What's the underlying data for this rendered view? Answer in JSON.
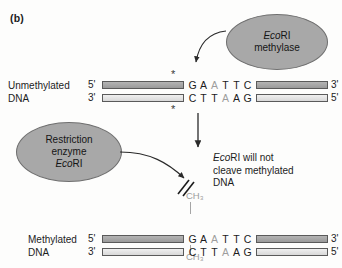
{
  "figure": {
    "panel_label": "(b)"
  },
  "enzymes": {
    "methylase": {
      "name_italic": "Eco",
      "name_roman": "RI",
      "line2": "methylase"
    },
    "restriction": {
      "line1": "Restriction",
      "line2": "enzyme",
      "name_italic": "Eco",
      "name_roman": "RI"
    }
  },
  "rows": {
    "unmethylated": {
      "label_line1": "Unmethylated",
      "label_line2": "DNA",
      "top_left_end": "5'",
      "top_right_end": "3'",
      "bottom_left_end": "3'",
      "bottom_right_end": "5'",
      "top_bases": [
        "G",
        "A",
        "A",
        "T",
        "T",
        "C"
      ],
      "bottom_bases": [
        "C",
        "T",
        "T",
        "A",
        "A",
        "G"
      ],
      "top_methyl_index": 2,
      "bottom_methyl_index": 3,
      "marker_top": "*",
      "marker_bottom": "*"
    },
    "methylated": {
      "label_line1": "Methylated",
      "label_line2": "DNA",
      "top_left_end": "5'",
      "top_right_end": "3'",
      "bottom_left_end": "3'",
      "bottom_right_end": "5'",
      "top_bases": [
        "G",
        "A",
        "A",
        "T",
        "T",
        "C"
      ],
      "bottom_bases": [
        "C",
        "T",
        "T",
        "A",
        "A",
        "G"
      ],
      "top_methyl_index": 2,
      "bottom_methyl_index": 3,
      "methyl_top_label": "CH₃",
      "methyl_bottom_label": "CH₃"
    }
  },
  "caption": {
    "line1_italic": "Eco",
    "line1_roman": "RI will not",
    "line2": "cleave methylated",
    "line3": "DNA"
  },
  "colors": {
    "oval_fill": "#a8a8a8",
    "oval_stroke": "#6f6f6f",
    "strand_dark": "#a8a8a8",
    "strand_light": "#e4e4e4",
    "methyl_grey": "#9d9d9d",
    "arrow": "#2a2a2a",
    "background": "#fdfdfc"
  }
}
